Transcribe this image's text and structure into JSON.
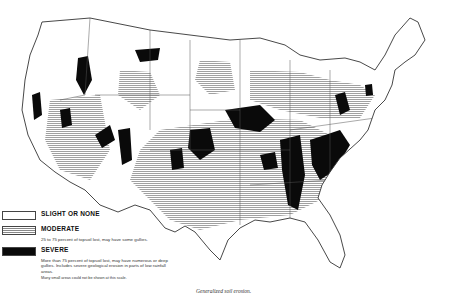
{
  "map": {
    "subject": "Contiguous United States",
    "caption": "Generalized soil erosion.",
    "colors": {
      "slight": "#ffffff",
      "moderate_hatch": "#888888",
      "severe": "#0a0a0a",
      "outline": "#333333"
    }
  },
  "legend": {
    "items": [
      {
        "key": "slight",
        "label": "SLIGHT OR NONE",
        "description": ""
      },
      {
        "key": "moderate",
        "label": "MODERATE",
        "description": "25 to 75 percent of topsoil lost, may have some gullies."
      },
      {
        "key": "severe",
        "label": "SEVERE",
        "description": "More than 75 percent of topsoil lost, may have numerous or deep gullies. Includes severe geological erosion in parts of low rainfall areas."
      }
    ],
    "note": "Many small areas could not be shown at this scale."
  }
}
